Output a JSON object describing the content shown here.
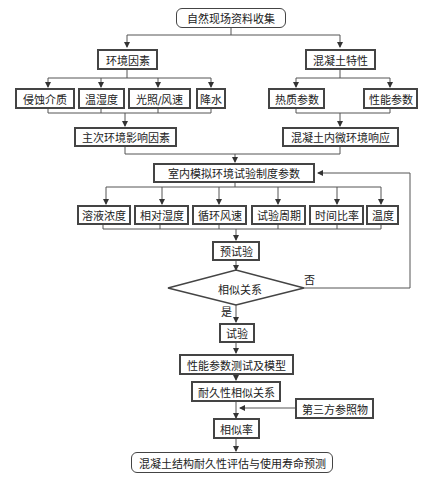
{
  "diagram": {
    "start": "自然现场资料收集",
    "left_branch": {
      "title": "环境因素",
      "items": [
        "侵蚀介质",
        "温湿度",
        "光照/风速",
        "降水"
      ],
      "result": "主次环境影响因素"
    },
    "right_branch": {
      "title": "混凝土特性",
      "items": [
        "热质参数",
        "性能参数"
      ],
      "result": "混凝土内微环境响应"
    },
    "lab_params": {
      "title": "室内模拟环境试验制度参数",
      "items": [
        "溶液浓度",
        "相对湿度",
        "循环风速",
        "试验周期",
        "时间比率",
        "温度"
      ]
    },
    "pretest": "预试验",
    "decision": {
      "label": "相似关系",
      "no": "否",
      "yes": "是"
    },
    "test": "试验",
    "performance": "性能参数测试及模型",
    "durability": "耐久性相似关系",
    "reference": "第三方参照物",
    "similarity_rate": "相似率",
    "end": "混凝土结构耐久性评估与使用寿命预测"
  }
}
